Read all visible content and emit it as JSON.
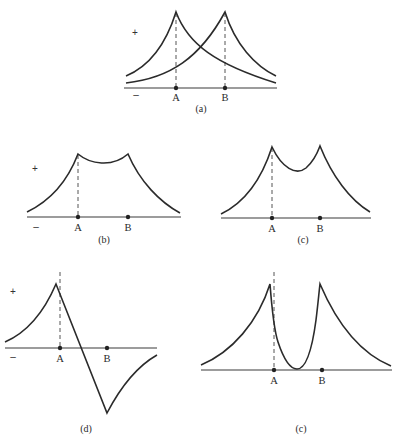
{
  "figure": {
    "panels": [
      {
        "id": "a",
        "caption": "(a)",
        "plus_sign": "+",
        "minus_sign": "–",
        "point_labels": [
          "A",
          "B"
        ],
        "description": "Two separate cusp-shaped distributions peaked at A and at B, crossing midway"
      },
      {
        "id": "b",
        "caption": "(b)",
        "plus_sign": "+",
        "minus_sign": "–",
        "point_labels": [
          "A",
          "B"
        ],
        "description": "Sum of two cusps with shallow dip between A and B"
      },
      {
        "id": "c",
        "caption": "(c)",
        "point_labels": [
          "A",
          "B"
        ],
        "description": "Sum of two cusps with deeper dip between A and B"
      },
      {
        "id": "d",
        "caption": "(d)",
        "plus_sign": "+",
        "minus_sign": "–",
        "point_labels": [
          "A",
          "B"
        ],
        "description": "Antisymmetric combination: positive cusp at A, negative cusp at B, linear crossing between"
      },
      {
        "id": "e",
        "caption": "(c)",
        "point_labels": [
          "A",
          "B"
        ],
        "description": "Two cusps with curve dropping to zero (node) between A and B"
      }
    ],
    "colors": {
      "curve": "#2b2b2b",
      "axis": "#3a3a3a",
      "background": "#ffffff"
    }
  }
}
